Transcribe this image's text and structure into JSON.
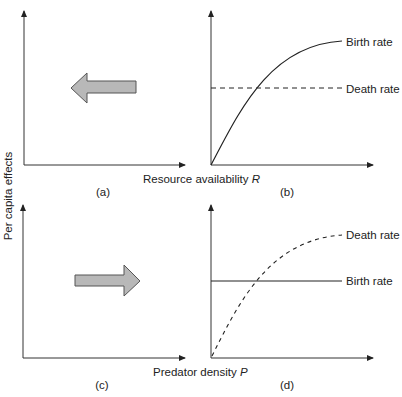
{
  "figure": {
    "y_axis_label": "Per capita effects",
    "top_row_x_label": "Resource availability ",
    "top_row_x_var": "R",
    "bottom_row_x_label": "Predator density ",
    "bottom_row_x_var": "P",
    "colors": {
      "line": "#222222",
      "arrow_fill": "#b8b8b8",
      "arrow_stroke": "#555555",
      "background": "#ffffff"
    },
    "panels": [
      {
        "id": "a",
        "label": "(a)",
        "content": "arrow",
        "arrow_direction": "left"
      },
      {
        "id": "b",
        "label": "(b)",
        "content": "rates",
        "curves": [
          {
            "name": "Birth rate",
            "style": "solid",
            "shape": "saturating-increase"
          },
          {
            "name": "Death rate",
            "style": "dashed",
            "shape": "constant"
          }
        ]
      },
      {
        "id": "c",
        "label": "(c)",
        "content": "arrow",
        "arrow_direction": "right"
      },
      {
        "id": "d",
        "label": "(d)",
        "content": "rates",
        "curves": [
          {
            "name": "Death rate",
            "style": "dashed",
            "shape": "saturating-increase"
          },
          {
            "name": "Birth rate",
            "style": "solid",
            "shape": "constant"
          }
        ]
      }
    ]
  }
}
